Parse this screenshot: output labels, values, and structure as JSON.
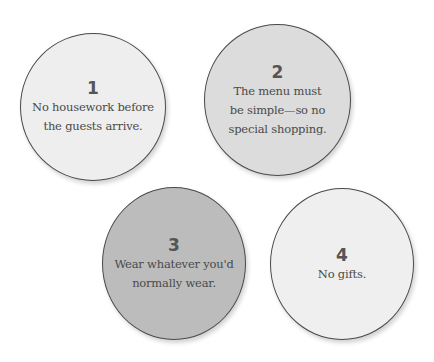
{
  "rules": [
    {
      "number": "1",
      "lines": [
        "No housework before",
        "the guests arrive."
      ],
      "fill": "#eeeeee"
    },
    {
      "number": "2",
      "lines": [
        "The menu must",
        "be simple—so no",
        "special shopping."
      ],
      "fill": "#dcdcdc"
    },
    {
      "number": "3",
      "lines": [
        "Wear whatever you'd",
        "normally wear."
      ],
      "fill": "#bcbcbc"
    },
    {
      "number": "4",
      "lines": [
        "No gifts."
      ],
      "fill": "#efefef"
    }
  ]
}
